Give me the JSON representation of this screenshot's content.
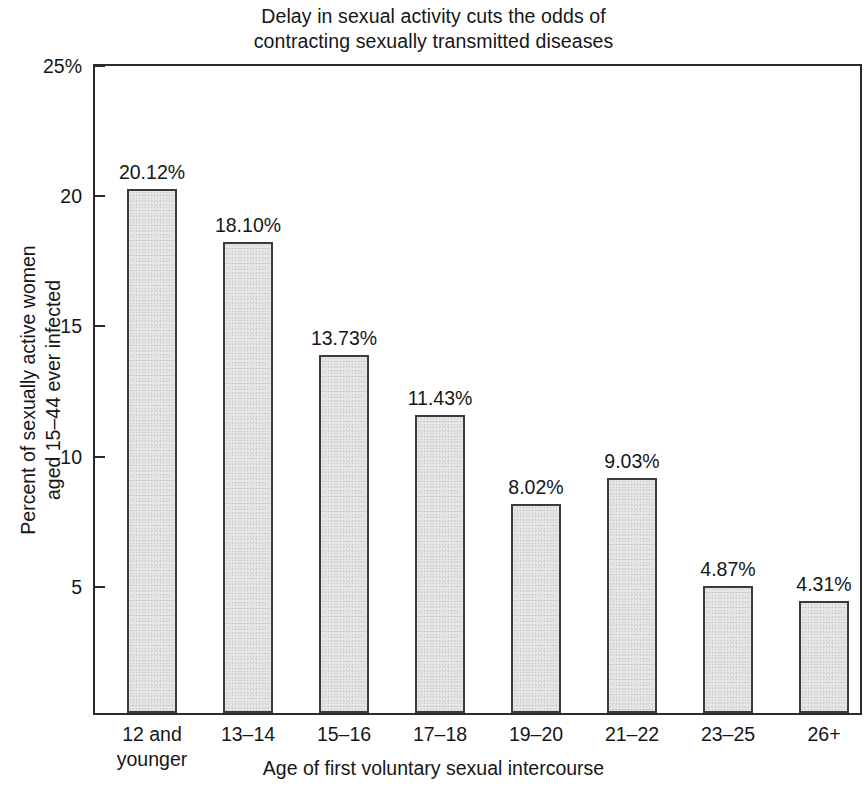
{
  "chart_data": {
    "type": "bar",
    "title": "Delay in sexual activity cuts the odds of contracting sexually transmitted diseases",
    "title_lines": [
      "Delay in sexual activity cuts the odds of",
      "contracting sexually transmitted diseases"
    ],
    "xlabel": "Age of first voluntary sexual intercourse",
    "ylabel": "Percent of sexually active women aged 15–44 ever infected",
    "ylabel_lines": [
      "Percent of sexually active women",
      "aged 15–44 ever infected"
    ],
    "categories": [
      "12 and younger",
      "13–14",
      "15–16",
      "17–18",
      "19–20",
      "21–22",
      "23–25",
      "26+"
    ],
    "category_lines": [
      [
        "12 and",
        "younger"
      ],
      [
        "13–14"
      ],
      [
        "15–16"
      ],
      [
        "17–18"
      ],
      [
        "19–20"
      ],
      [
        "21–22"
      ],
      [
        "23–25"
      ],
      [
        "26+"
      ]
    ],
    "values": [
      20.12,
      18.1,
      13.73,
      11.43,
      8.02,
      9.03,
      4.87,
      4.31
    ],
    "value_labels": [
      "20.12%",
      "18.10%",
      "13.73%",
      "11.43%",
      "8.02%",
      "9.03%",
      "4.87%",
      "4.31%"
    ],
    "ylim": [
      0,
      25
    ],
    "yticks": [
      25,
      20,
      15,
      10,
      5
    ],
    "ytick_labels": [
      "25%",
      "20",
      "15",
      "10",
      "5"
    ],
    "grid": false,
    "legend": null,
    "bar_fill_color": "#e6e6e6",
    "bar_border_color": "#3a3a3a",
    "axis_color": "#2b2b2b",
    "text_color": "#161616",
    "background_color": "#ffffff"
  }
}
